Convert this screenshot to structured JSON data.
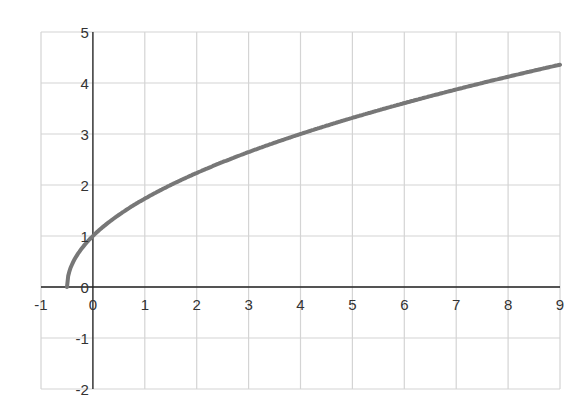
{
  "chart_data": {
    "type": "line",
    "title": "",
    "xlabel": "",
    "ylabel": "",
    "xlim": [
      -1,
      9
    ],
    "ylim": [
      -2,
      5
    ],
    "grid": true,
    "legend": null,
    "x_ticks": [
      "-1",
      "0",
      "1",
      "2",
      "3",
      "4",
      "5",
      "6",
      "7",
      "8",
      "9"
    ],
    "y_ticks": [
      "5",
      "4",
      "3",
      "2",
      "1",
      "0",
      "-1",
      "-2"
    ],
    "series": [
      {
        "name": "y = sqrt(2x+1)",
        "color": "#777777",
        "x": [
          -0.5,
          -0.45,
          -0.4,
          -0.3,
          -0.2,
          -0.1,
          0,
          0.25,
          0.5,
          1,
          1.5,
          2,
          3,
          4,
          5,
          6,
          7,
          8,
          9
        ],
        "y": [
          0,
          0.32,
          0.45,
          0.63,
          0.77,
          0.89,
          1,
          1.22,
          1.41,
          1.73,
          2,
          2.24,
          2.65,
          3,
          3.32,
          3.61,
          3.87,
          4.12,
          4.36
        ]
      }
    ]
  },
  "colors": {
    "grid": "#d4d4d4",
    "axis": "#222222",
    "curve": "#777777"
  }
}
